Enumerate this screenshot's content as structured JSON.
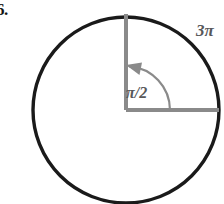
{
  "figure": {
    "problem_number": "6.",
    "background_color": "#ffffff",
    "circle": {
      "name": "circle-outline",
      "center_x": 126,
      "center_y": 110,
      "radius": 93,
      "stroke_color": "#1a1a1a",
      "stroke_width": 3.4,
      "fill": "none"
    },
    "radii": [
      {
        "name": "vertical-radius",
        "from": [
          126,
          110
        ],
        "to": [
          126,
          17
        ],
        "direction": "up",
        "angle_degrees": 90,
        "stroke_color": "#8a8a8a",
        "stroke_width": 4
      },
      {
        "name": "horizontal-radius",
        "from": [
          126,
          110
        ],
        "to": [
          219,
          110
        ],
        "direction": "right",
        "angle_degrees": 0,
        "stroke_color": "#8a8a8a",
        "stroke_width": 4
      }
    ],
    "arc": {
      "name": "angle-arc",
      "radius": 44,
      "start_angle_degrees": 0,
      "end_angle_degrees": 90,
      "sweep": "counterclockwise",
      "arrow_at": "end",
      "stroke_color": "#8a8a8a",
      "stroke_width": 2.2
    },
    "labels": {
      "angle": "π/2",
      "arc_length": "3π"
    }
  }
}
